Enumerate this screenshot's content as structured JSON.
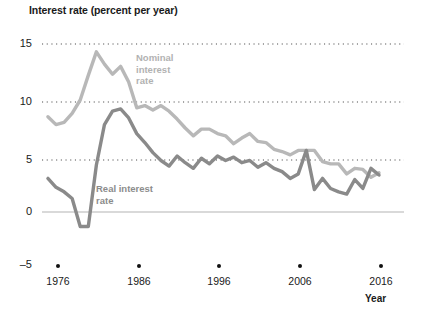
{
  "chart_data": {
    "type": "line",
    "title": "Interest rate (percent per year)",
    "xlabel": "Year",
    "ylabel": "Interest rate (percent per year)",
    "xlim": [
      1973,
      2017
    ],
    "ylim": [
      -5,
      15
    ],
    "yticks": [
      15,
      10,
      5,
      0,
      -5
    ],
    "ytick_labels": [
      "15",
      "10",
      "5",
      "0",
      "–5"
    ],
    "xticks": [
      1976,
      1986,
      1996,
      2006,
      2016
    ],
    "xtick_labels": [
      "1976",
      "1986",
      "1996",
      "2006",
      "2016"
    ],
    "grid": "dotted horizontal gridlines at 15, 10 and 5; solid light line at 0",
    "legend_position": "inline annotations on plot",
    "x": [
      1975,
      1976,
      1977,
      1978,
      1979,
      1980,
      1981,
      1982,
      1983,
      1984,
      1985,
      1986,
      1987,
      1988,
      1989,
      1990,
      1991,
      1992,
      1993,
      1994,
      1995,
      1996,
      1997,
      1998,
      1999,
      2000,
      2001,
      2002,
      2003,
      2004,
      2005,
      2006,
      2007,
      2008,
      2009,
      2010,
      2011,
      2012,
      2013,
      2014,
      2015,
      2016
    ],
    "series": [
      {
        "name": "Nominal interest rate",
        "label_text": "Nominal interest rate",
        "color": "#b8b8b8",
        "values": [
          8.5,
          7.8,
          8.0,
          8.8,
          10.0,
          12.2,
          14.3,
          13.2,
          12.3,
          13.0,
          11.6,
          9.3,
          9.5,
          9.1,
          9.5,
          9.0,
          8.3,
          7.5,
          6.8,
          7.4,
          7.4,
          7.0,
          6.8,
          6.1,
          6.6,
          7.0,
          6.3,
          6.2,
          5.6,
          5.4,
          5.1,
          5.5,
          5.5,
          5.5,
          4.5,
          4.3,
          4.3,
          3.4,
          3.9,
          3.8,
          3.1,
          3.5
        ]
      },
      {
        "name": "Real interest rate",
        "label_text": "Real interest rate",
        "color": "#8a8a8a",
        "values": [
          3.0,
          2.2,
          1.8,
          1.2,
          -1.3,
          -1.3,
          4.2,
          7.8,
          9.0,
          9.2,
          8.4,
          7.0,
          6.2,
          5.3,
          4.6,
          4.1,
          5.0,
          4.4,
          3.9,
          4.8,
          4.3,
          5.0,
          4.6,
          4.9,
          4.4,
          4.6,
          4.0,
          4.4,
          3.9,
          3.6,
          3.0,
          3.4,
          5.5,
          2.0,
          3.0,
          2.1,
          1.8,
          1.6,
          2.9,
          2.1,
          3.9,
          3.3
        ]
      }
    ],
    "annotations": [
      {
        "text": "Nominal interest rate",
        "target": "nominal series"
      },
      {
        "text": "Real interest rate",
        "target": "real series"
      }
    ]
  }
}
